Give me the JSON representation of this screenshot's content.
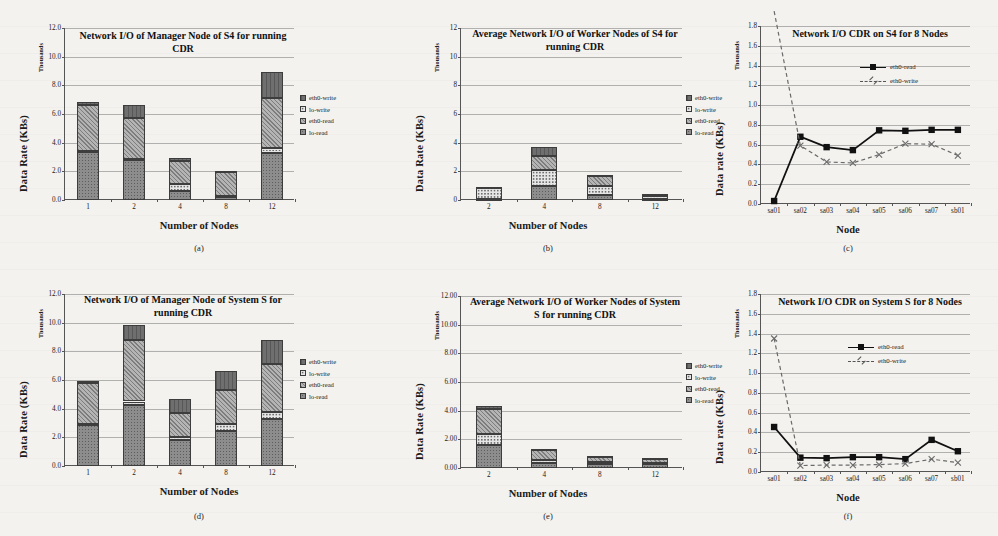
{
  "figure": {
    "bar_legend": [
      "eth0-write",
      "lo-write",
      "eth0-read",
      "lo-read"
    ],
    "line_legend": [
      "eth0-read",
      "eth0-write"
    ],
    "axis_secondary_label": "Thousands",
    "captions": [
      "(a)",
      "(b)",
      "(c)",
      "(d)",
      "(e)",
      "(f)"
    ]
  },
  "chart_data": [
    {
      "id": "a",
      "type": "bar",
      "stacked": true,
      "title": "Network I/O of Manager Node of S4 for running CDR",
      "xlabel": "Number of Nodes",
      "ylabel": "Data Rate (KBs)",
      "y_secondary_label": "Thousands",
      "categories": [
        "1",
        "2",
        "4",
        "8",
        "12"
      ],
      "yticks": [
        "0.0",
        "2.0",
        "4.0",
        "6.0",
        "8.0",
        "10.0",
        "12.0"
      ],
      "ylim": [
        0,
        12
      ],
      "grid": true,
      "legend_position": "right",
      "series": [
        {
          "name": "lo-read",
          "values": [
            3.35,
            2.8,
            0.6,
            0.18,
            3.3
          ]
        },
        {
          "name": "lo-write",
          "values": [
            0.05,
            0.05,
            0.55,
            0.12,
            0.3
          ]
        },
        {
          "name": "eth0-read",
          "values": [
            3.25,
            2.85,
            1.55,
            1.7,
            3.55
          ]
        },
        {
          "name": "eth0-write",
          "values": [
            0.2,
            0.9,
            0.2,
            0.05,
            1.75
          ]
        }
      ],
      "totals": [
        6.85,
        6.6,
        2.9,
        2.05,
        8.9
      ]
    },
    {
      "id": "b",
      "type": "bar",
      "stacked": true,
      "title": "Average Network I/O of Worker Nodes of S4 for running CDR",
      "xlabel": "Number of Nodes",
      "ylabel": "Data Rate (KBs)",
      "y_secondary_label": "Thousands",
      "categories": [
        "2",
        "4",
        "8",
        "12"
      ],
      "yticks": [
        "0",
        "2",
        "4",
        "6",
        "8",
        "10",
        "12"
      ],
      "ylim": [
        0,
        12
      ],
      "grid": true,
      "legend_position": "right",
      "series": [
        {
          "name": "lo-read",
          "values": [
            0.1,
            1.0,
            0.35,
            0.1
          ]
        },
        {
          "name": "lo-write",
          "values": [
            0.75,
            1.1,
            0.6,
            0.15
          ]
        },
        {
          "name": "eth0-read",
          "values": [
            0.05,
            1.0,
            0.7,
            0.15
          ]
        },
        {
          "name": "eth0-write",
          "values": [
            0.02,
            0.6,
            0.1,
            0.05
          ]
        }
      ],
      "totals": [
        0.92,
        3.7,
        1.75,
        0.45
      ]
    },
    {
      "id": "c",
      "type": "line",
      "title": "Network I/O CDR on S4 for 8 Nodes",
      "xlabel": "Node",
      "ylabel": "Data rate (KBs)",
      "y_secondary_label": "Thousands",
      "x": [
        "sa01",
        "sa02",
        "sa03",
        "sa04",
        "sa05",
        "sa06",
        "sa07",
        "sb01"
      ],
      "yticks": [
        "0.0",
        "0.2",
        "0.4",
        "0.6",
        "0.8",
        "1.0",
        "1.2",
        "1.4",
        "1.6",
        "1.8"
      ],
      "ylim": [
        0,
        1.8
      ],
      "grid": true,
      "legend_position": "upper-right",
      "series": [
        {
          "name": "eth0-read",
          "style": "solid-square",
          "values": [
            0.03,
            0.68,
            0.575,
            0.545,
            0.745,
            0.74,
            0.75,
            0.75
          ]
        },
        {
          "name": "eth0-write",
          "style": "dashed-x",
          "values": [
            1.95,
            0.59,
            0.425,
            0.415,
            0.5,
            0.61,
            0.605,
            0.49
          ]
        }
      ]
    },
    {
      "id": "d",
      "type": "bar",
      "stacked": true,
      "title": "Network I/O of Manager Node of System S for running CDR",
      "xlabel": "Number of Nodes",
      "ylabel": "Data Rate (KBs)",
      "y_secondary_label": "Thousands",
      "categories": [
        "1",
        "2",
        "4",
        "8",
        "12"
      ],
      "yticks": [
        "0.0",
        "2.0",
        "4.0",
        "6.0",
        "8.0",
        "10.0",
        "12.0"
      ],
      "ylim": [
        0,
        12
      ],
      "grid": true,
      "legend_position": "right",
      "series": [
        {
          "name": "lo-read",
          "values": [
            2.9,
            4.25,
            1.8,
            2.45,
            3.25
          ]
        },
        {
          "name": "lo-write",
          "values": [
            0.05,
            0.25,
            0.2,
            0.5,
            0.55
          ]
        },
        {
          "name": "eth0-read",
          "values": [
            2.85,
            4.3,
            1.7,
            2.35,
            3.3
          ]
        },
        {
          "name": "eth0-write",
          "values": [
            0.1,
            1.05,
            0.95,
            1.35,
            1.7
          ]
        }
      ],
      "totals": [
        5.9,
        9.85,
        4.65,
        6.65,
        8.8
      ]
    },
    {
      "id": "e",
      "type": "bar",
      "stacked": true,
      "title": "Average Network I/O of Worker Nodes of System S for running CDR",
      "xlabel": "Number of Nodes",
      "ylabel": "Data Rate (KBs)",
      "y_secondary_label": "Thousands",
      "categories": [
        "2",
        "4",
        "8",
        "12"
      ],
      "yticks": [
        "0.00",
        "2.00",
        "4.00",
        "6.00",
        "8.00",
        "10.00",
        "12.00"
      ],
      "ylim": [
        0,
        12
      ],
      "grid": true,
      "legend_position": "right",
      "series": [
        {
          "name": "lo-read",
          "values": [
            1.6,
            0.35,
            0.3,
            0.25
          ]
        },
        {
          "name": "lo-write",
          "values": [
            0.8,
            0.2,
            0.1,
            0.1
          ]
        },
        {
          "name": "eth0-read",
          "values": [
            1.7,
            0.75,
            0.45,
            0.3
          ]
        },
        {
          "name": "eth0-write",
          "values": [
            0.2,
            0.05,
            0.02,
            0.02
          ]
        }
      ],
      "totals": [
        4.3,
        1.35,
        0.87,
        0.67
      ]
    },
    {
      "id": "f",
      "type": "line",
      "title": "Network I/O CDR on System S for 8 Nodes",
      "xlabel": "Node",
      "ylabel": "Data rate (KBs)",
      "y_secondary_label": "Thousands",
      "x": [
        "sa01",
        "sa02",
        "sa03",
        "sa04",
        "sa05",
        "sa06",
        "sa07",
        "sb01"
      ],
      "yticks": [
        "0.0",
        "0.2",
        "0.4",
        "0.6",
        "0.8",
        "1.0",
        "1.2",
        "1.4",
        "1.6",
        "1.8"
      ],
      "ylim": [
        0,
        1.8
      ],
      "grid": true,
      "legend_position": "upper-right",
      "series": [
        {
          "name": "eth0-read",
          "style": "solid-square",
          "values": [
            0.455,
            0.145,
            0.14,
            0.15,
            0.15,
            0.13,
            0.325,
            0.21
          ]
        },
        {
          "name": "eth0-write",
          "style": "dashed-x",
          "values": [
            1.35,
            0.065,
            0.07,
            0.07,
            0.075,
            0.085,
            0.13,
            0.095
          ]
        }
      ]
    }
  ]
}
